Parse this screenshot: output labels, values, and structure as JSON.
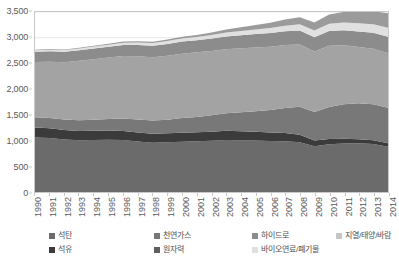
{
  "chart_data": {
    "type": "area",
    "stacked": true,
    "title": "",
    "subtitle": "",
    "xlabel": "",
    "ylabel": "",
    "grid": true,
    "legend_position": "bottom",
    "ylim": [
      0,
      3500
    ],
    "ytick_step": 500,
    "ytick_labels": [
      "0",
      "500",
      "1,000",
      "1,500",
      "2,000",
      "2,500",
      "3,000",
      "3,500"
    ],
    "ytick_values": [
      0,
      500,
      1000,
      1500,
      2000,
      2500,
      3000,
      3500
    ],
    "categories": [
      "1990",
      "1991",
      "1992",
      "1993",
      "1994",
      "1995",
      "1996",
      "1997",
      "1998",
      "1999",
      "2000",
      "2001",
      "2002",
      "2003",
      "2004",
      "2005",
      "2006",
      "2007",
      "2008",
      "2009",
      "2010",
      "2011",
      "2012",
      "2013",
      "2014"
    ],
    "series": [
      {
        "name": "석탄",
        "color": "#6b6b6b",
        "values": [
          1060,
          1050,
          1020,
          1005,
          1010,
          1015,
          1010,
          980,
          960,
          965,
          975,
          985,
          995,
          1010,
          1005,
          1000,
          990,
          985,
          965,
          890,
          930,
          945,
          950,
          935,
          880
        ]
      },
      {
        "name": "석유",
        "color": "#3b3b3b",
        "values": [
          195,
          190,
          185,
          180,
          180,
          180,
          175,
          175,
          175,
          175,
          175,
          175,
          175,
          180,
          175,
          170,
          165,
          160,
          150,
          110,
          100,
          90,
          75,
          70,
          70
        ]
      },
      {
        "name": "천연가스",
        "color": "#787878",
        "values": [
          200,
          200,
          205,
          210,
          215,
          225,
          245,
          255,
          255,
          265,
          290,
          300,
          320,
          340,
          370,
          400,
          440,
          490,
          545,
          555,
          625,
          670,
          700,
          700,
          690
        ]
      },
      {
        "name": "원자력",
        "color": "#a3a3a3",
        "values": [
          1075,
          1095,
          1115,
          1155,
          1175,
          1195,
          1215,
          1230,
          1230,
          1245,
          1250,
          1255,
          1250,
          1245,
          1245,
          1240,
          1230,
          1225,
          1210,
          1175,
          1190,
          1150,
          1095,
          1080,
          1060
        ]
      },
      {
        "name": "하이드로",
        "color": "#8c8c8c",
        "values": [
          195,
          200,
          200,
          205,
          210,
          210,
          215,
          220,
          225,
          230,
          235,
          235,
          245,
          250,
          255,
          260,
          265,
          265,
          270,
          280,
          285,
          290,
          300,
          310,
          320
        ]
      },
      {
        "name": "바이오연료/폐기물",
        "color": "#e0e0e0",
        "values": [
          30,
          32,
          34,
          36,
          38,
          40,
          43,
          46,
          50,
          54,
          58,
          62,
          68,
          75,
          82,
          90,
          100,
          110,
          122,
          130,
          142,
          152,
          160,
          168,
          175
        ]
      },
      {
        "name": "지열/태양/바람",
        "color": "#9b9b9b",
        "values": [
          12,
          13,
          14,
          15,
          17,
          19,
          21,
          24,
          27,
          31,
          36,
          42,
          50,
          58,
          70,
          85,
          100,
          118,
          138,
          155,
          180,
          205,
          230,
          255,
          280
        ]
      }
    ]
  },
  "legend": {
    "items": [
      {
        "label": "석탄",
        "color": "#6b6b6b",
        "col": 0,
        "row": 0
      },
      {
        "label": "석유",
        "color": "#3b3b3b",
        "col": 0,
        "row": 1
      },
      {
        "label": "천연가스",
        "color": "#787878",
        "col": 1,
        "row": 0
      },
      {
        "label": "원자력",
        "color": "#5f5f5f",
        "col": 1,
        "row": 1
      },
      {
        "label": "하이드로",
        "color": "#8c8c8c",
        "col": 2,
        "row": 0
      },
      {
        "label": "바이오연료/폐기물",
        "color": "#e0e0e0",
        "col": 2,
        "row": 1
      },
      {
        "label": "지열/태양/바람",
        "color": "#c6c6c6",
        "col": 3,
        "row": 0
      }
    ]
  },
  "style": {
    "grid_color": "#e8e8e8",
    "axis_color": "#c9c9c9",
    "text_color": "#5a5a5a",
    "background": "#ffffff"
  }
}
